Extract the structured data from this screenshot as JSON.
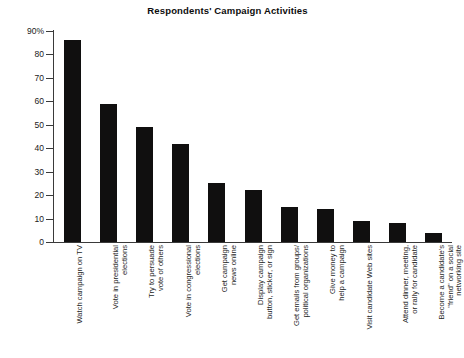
{
  "chart_data": {
    "type": "bar",
    "title": "Respondents' Campaign Activities",
    "xlabel": "",
    "ylabel": "",
    "ylim": [
      0,
      90
    ],
    "grid": false,
    "legend": null,
    "orientation": "vertical",
    "bar_color": "#100f0f",
    "ytick_labels": [
      "90%",
      "80",
      "70",
      "60",
      "50",
      "40",
      "30",
      "20",
      "10",
      "0"
    ],
    "ytick_values": [
      90,
      80,
      70,
      60,
      50,
      40,
      30,
      20,
      10,
      0
    ],
    "categories": [
      "Watch campaign on TV",
      "Vote in presidential\nelections",
      "Try to persuade\nvote of others",
      "Vote in congressional\nelections",
      "Get campaign\nnews online",
      "Display campaign\nbutton, sticker, or sign",
      "Get emails from groups/\npolitical organizations",
      "Give money to\nhelp a campaign",
      "Visit candidate Web sites",
      "Attend dinner, meeting,\nor rally for candidate",
      "Become a candidate's\n\"friend\" on a social\nnetworking site"
    ],
    "values": [
      86,
      59,
      49,
      42,
      25,
      22,
      15,
      14,
      9,
      8,
      4
    ]
  }
}
